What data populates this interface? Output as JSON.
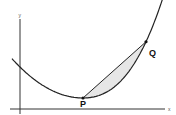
{
  "diagram": {
    "axes": {
      "x_label": "x",
      "y_label": "y"
    },
    "points": [
      {
        "id": "P",
        "label": "P"
      },
      {
        "id": "Q",
        "label": "Q"
      }
    ],
    "shaded_region": "area between chord PQ and the curve",
    "colors": {
      "curve": "#222222",
      "shade": "#e6e6e6",
      "axis": "#333333"
    }
  }
}
